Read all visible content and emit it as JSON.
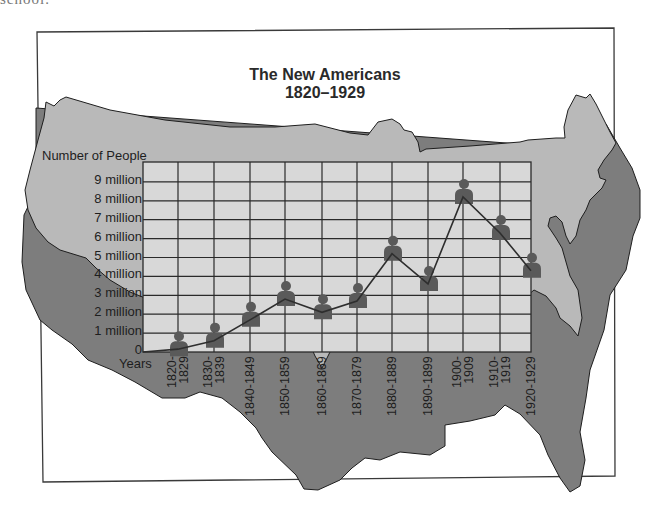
{
  "page": {
    "cutoff_text": "school."
  },
  "chart_data": {
    "type": "line",
    "title": "The New Americans",
    "subtitle": "1820–1929",
    "ylabel": "Number of People",
    "xlabel": "Years",
    "ylim": [
      0,
      10
    ],
    "y_unit": "million",
    "y_ticks": [
      "0",
      "1 million",
      "2 million",
      "3 million",
      "4 million",
      "5 million",
      "6 million",
      "7 million",
      "8 million",
      "9 million"
    ],
    "categories": [
      "1820-\n1829",
      "1830-\n1839",
      "1840-1849",
      "1850-1859",
      "1860-1869",
      "1870-1879",
      "1880-1889",
      "1890-1899",
      "1900-\n1909",
      "1910-\n1919",
      "1920-1929"
    ],
    "series": [
      {
        "name": "Immigrants (millions)",
        "values": [
          0.15,
          0.6,
          1.7,
          2.8,
          2.1,
          2.7,
          5.2,
          3.6,
          8.2,
          6.3,
          4.3
        ],
        "marker": "person-icon"
      }
    ],
    "grid": true,
    "legend": null,
    "background": "map of the United States",
    "colors": {
      "map_fill": "#b9b9b9",
      "map_shadow": "#7d7d7d",
      "grid_fill": "#d8d8d8",
      "grid_line": "#2a2a2a",
      "marker": "#5a5a5a",
      "line": "#2e2e2e"
    }
  }
}
